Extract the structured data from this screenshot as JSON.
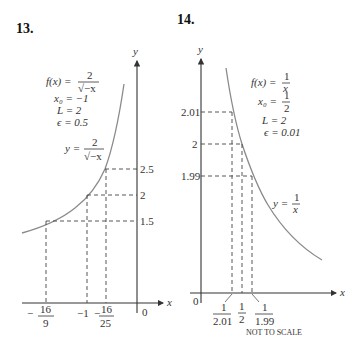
{
  "figures": [
    {
      "number": "13.",
      "axis_x_label": "x",
      "axis_y_label": "y",
      "params": {
        "f_lhs": "f(x) =",
        "f_num": "2",
        "f_den": "√−x",
        "x0": "x₀ = −1",
        "L": "L = 2",
        "eps": "ϵ = 0.5"
      },
      "curve_label": {
        "lhs": "y =",
        "num": "2",
        "den": "√−x"
      },
      "y_ticks": [
        "2.5",
        "2",
        "1.5"
      ],
      "x_ticks": [
        {
          "sign": "−",
          "num": "16",
          "den": "9"
        },
        {
          "text": "−1"
        },
        {
          "sign": "−",
          "num": "16",
          "den": "25"
        }
      ],
      "origin": "0"
    },
    {
      "number": "14.",
      "axis_x_label": "x",
      "axis_y_label": "y",
      "params": {
        "f_lhs": "f(x) =",
        "f_num": "1",
        "f_den": "x",
        "x0_lhs": "x₀ =",
        "x0_num": "1",
        "x0_den": "2",
        "L": "L = 2",
        "eps": "ϵ = 0.01"
      },
      "curve_label": {
        "lhs": "y =",
        "num": "1",
        "den": "x"
      },
      "y_ticks": [
        "2.01",
        "2",
        "1.99"
      ],
      "x_ticks": [
        {
          "num": "1",
          "den": "2.01"
        },
        {
          "num": "1",
          "den": "2"
        },
        {
          "num": "1",
          "den": "1.99"
        }
      ],
      "origin": "0",
      "note": "NOT TO SCALE"
    }
  ]
}
